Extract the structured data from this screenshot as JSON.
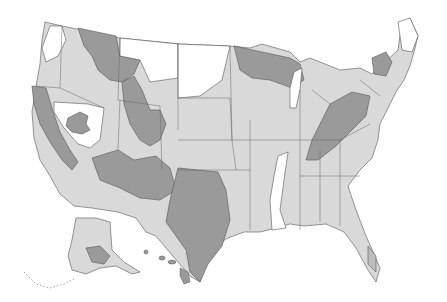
{
  "map": {
    "subject": "Contiguous United States, Alaska and Hawaii with shaded regions",
    "background": "#ffffff",
    "shades": {
      "white": "#ffffff",
      "light": "#d9d9d9",
      "medium": "#bdbdbd",
      "dark": "#9a9a9a",
      "border": "#555555",
      "coast": "#222222"
    },
    "insets": [
      "Alaska",
      "Hawaii"
    ]
  }
}
